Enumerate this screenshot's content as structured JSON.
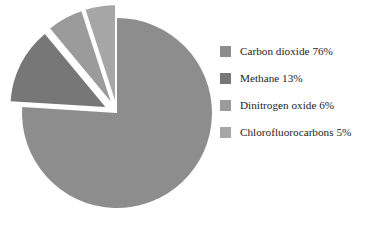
{
  "chart_data": {
    "type": "pie",
    "title": "",
    "subtitle": "",
    "xlabel": "",
    "ylabel": "",
    "grid": false,
    "legend_position": "right",
    "start_angle_deg": 0,
    "direction": "clockwise",
    "categories": [
      "Carbon dioxide",
      "Methane",
      "Dinitrogen oxide",
      "Chlorofluorocarbons"
    ],
    "values": [
      76,
      13,
      6,
      5
    ],
    "unit": "%",
    "slices": [
      {
        "label": "Carbon dioxide",
        "value": 76,
        "legend_text": "Carbon dioxide 76%",
        "color": "#8d8d8d",
        "exploded": false,
        "explode_offset_px": 0,
        "start_deg": 0,
        "end_deg": 273.6
      },
      {
        "label": "Methane",
        "value": 13,
        "legend_text": "Methane 13%",
        "color": "#777777",
        "exploded": true,
        "explode_offset_px": 13,
        "start_deg": 273.6,
        "end_deg": 320.4
      },
      {
        "label": "Dinitrogen oxide",
        "value": 6,
        "legend_text": "Dinitrogen oxide 6%",
        "color": "#9b9b9b",
        "exploded": true,
        "explode_offset_px": 13,
        "start_deg": 320.4,
        "end_deg": 342.0
      },
      {
        "label": "Chlorofluorocarbons",
        "value": 5,
        "legend_text": "Chlorofluorocarbons 5%",
        "color": "#a6a6a6",
        "exploded": true,
        "explode_offset_px": 13,
        "start_deg": 342.0,
        "end_deg": 360.0
      }
    ]
  },
  "legend": {
    "items": [
      {
        "label": "Carbon dioxide 76%",
        "color": "#8d8d8d"
      },
      {
        "label": "Methane 13%",
        "color": "#777777"
      },
      {
        "label": "Dinitrogen oxide 6%",
        "color": "#9b9b9b"
      },
      {
        "label": "Chlorofluorocarbons 5%",
        "color": "#a6a6a6"
      }
    ]
  },
  "canvas": {
    "background": "#ffffff",
    "center_x": 117,
    "center_y": 113,
    "radius": 95
  }
}
